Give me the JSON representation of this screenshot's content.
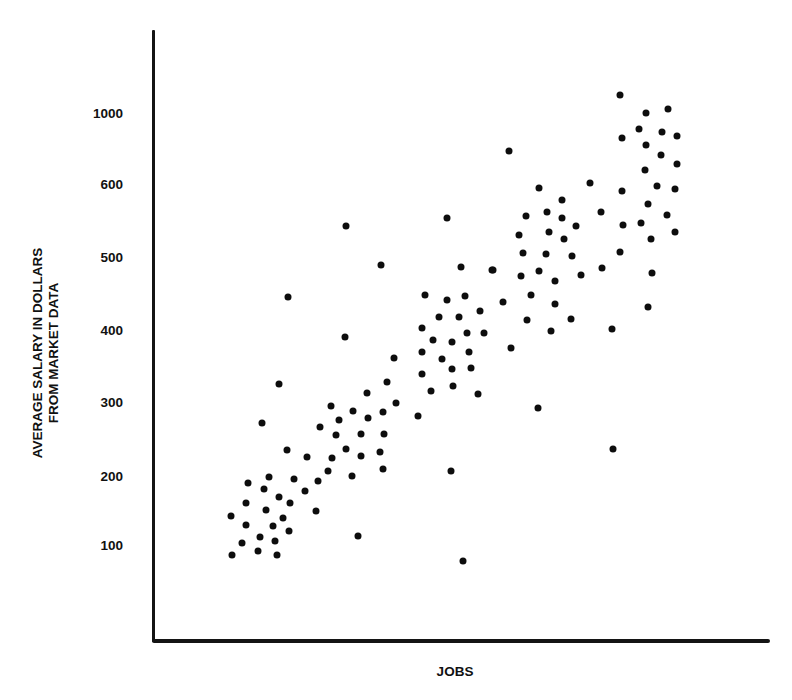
{
  "chart_data": {
    "type": "scatter",
    "title": "",
    "xlabel": "JOBS",
    "ylabel": "AVERAGE SALARY IN DOLLARS FROM MARKET DATA",
    "ylabel_lines": [
      "AVERAGE SALARY IN DOLLARS",
      "FROM MARKET DATA"
    ],
    "yticks": [
      100,
      200,
      300,
      400,
      500,
      600,
      1000
    ],
    "ytick_labels": [
      "100",
      "200",
      "300",
      "400",
      "500",
      "600",
      "1000"
    ],
    "y_scale_note": "non-uniform axis: equal spacing between 100..600 and 600..1000",
    "xticks": [],
    "xlim": [
      0,
      100
    ],
    "ylim": [
      0,
      1200
    ],
    "grid": false,
    "legend": null,
    "x_units": "relative position along unlabeled JOBS axis (0-100)",
    "series": [
      {
        "name": "jobs",
        "color": "#0d0d0d",
        "points": [
          {
            "x": 12.8,
            "y": 86
          },
          {
            "x": 14.4,
            "y": 103
          },
          {
            "x": 12.6,
            "y": 142
          },
          {
            "x": 15.1,
            "y": 129
          },
          {
            "x": 15.1,
            "y": 161
          },
          {
            "x": 15.4,
            "y": 190
          },
          {
            "x": 18.8,
            "y": 199
          },
          {
            "x": 18.0,
            "y": 181
          },
          {
            "x": 17.0,
            "y": 91
          },
          {
            "x": 17.3,
            "y": 112
          },
          {
            "x": 18.3,
            "y": 151
          },
          {
            "x": 19.4,
            "y": 128
          },
          {
            "x": 19.8,
            "y": 106
          },
          {
            "x": 20.1,
            "y": 86
          },
          {
            "x": 20.4,
            "y": 170
          },
          {
            "x": 21.1,
            "y": 139
          },
          {
            "x": 22.2,
            "y": 161
          },
          {
            "x": 22.0,
            "y": 120
          },
          {
            "x": 22.9,
            "y": 196
          },
          {
            "x": 24.6,
            "y": 178
          },
          {
            "x": 26.4,
            "y": 149
          },
          {
            "x": 26.7,
            "y": 193
          },
          {
            "x": 25.0,
            "y": 226
          },
          {
            "x": 21.7,
            "y": 235
          },
          {
            "x": 28.4,
            "y": 207
          },
          {
            "x": 21.9,
            "y": 445
          },
          {
            "x": 20.4,
            "y": 325
          },
          {
            "x": 17.7,
            "y": 272
          },
          {
            "x": 29.0,
            "y": 224
          },
          {
            "x": 31.3,
            "y": 236
          },
          {
            "x": 33.7,
            "y": 227
          },
          {
            "x": 36.8,
            "y": 232
          },
          {
            "x": 37.3,
            "y": 209
          },
          {
            "x": 32.3,
            "y": 200
          },
          {
            "x": 27.1,
            "y": 266
          },
          {
            "x": 29.7,
            "y": 255
          },
          {
            "x": 33.7,
            "y": 257
          },
          {
            "x": 37.4,
            "y": 257
          },
          {
            "x": 30.1,
            "y": 276
          },
          {
            "x": 28.8,
            "y": 295
          },
          {
            "x": 32.4,
            "y": 288
          },
          {
            "x": 34.8,
            "y": 278
          },
          {
            "x": 37.3,
            "y": 286
          },
          {
            "x": 34.7,
            "y": 313
          },
          {
            "x": 37.9,
            "y": 328
          },
          {
            "x": 39.4,
            "y": 299
          },
          {
            "x": 39.1,
            "y": 361
          },
          {
            "x": 31.1,
            "y": 390
          },
          {
            "x": 31.3,
            "y": 542
          },
          {
            "x": 37.0,
            "y": 489
          },
          {
            "x": 47.6,
            "y": 553
          },
          {
            "x": 49.9,
            "y": 486
          },
          {
            "x": 54.9,
            "y": 482
          },
          {
            "x": 44.1,
            "y": 448
          },
          {
            "x": 47.6,
            "y": 441
          },
          {
            "x": 50.6,
            "y": 447
          },
          {
            "x": 53.0,
            "y": 426
          },
          {
            "x": 46.4,
            "y": 418
          },
          {
            "x": 49.6,
            "y": 418
          },
          {
            "x": 43.6,
            "y": 403
          },
          {
            "x": 50.9,
            "y": 396
          },
          {
            "x": 53.6,
            "y": 396
          },
          {
            "x": 45.4,
            "y": 386
          },
          {
            "x": 48.5,
            "y": 383
          },
          {
            "x": 43.6,
            "y": 369
          },
          {
            "x": 51.2,
            "y": 369
          },
          {
            "x": 46.8,
            "y": 360
          },
          {
            "x": 48.5,
            "y": 346
          },
          {
            "x": 51.5,
            "y": 347
          },
          {
            "x": 43.6,
            "y": 339
          },
          {
            "x": 48.6,
            "y": 322
          },
          {
            "x": 45.1,
            "y": 315
          },
          {
            "x": 52.7,
            "y": 311
          },
          {
            "x": 42.9,
            "y": 281
          },
          {
            "x": 48.3,
            "y": 207
          },
          {
            "x": 33.2,
            "y": 113
          },
          {
            "x": 50.2,
            "y": 77
          },
          {
            "x": 57.7,
            "y": 786
          },
          {
            "x": 62.6,
            "y": 595
          },
          {
            "x": 70.8,
            "y": 606
          },
          {
            "x": 66.3,
            "y": 578
          },
          {
            "x": 60.5,
            "y": 556
          },
          {
            "x": 63.9,
            "y": 562
          },
          {
            "x": 66.3,
            "y": 553
          },
          {
            "x": 72.6,
            "y": 562
          },
          {
            "x": 68.6,
            "y": 542
          },
          {
            "x": 59.3,
            "y": 530
          },
          {
            "x": 64.2,
            "y": 534
          },
          {
            "x": 66.6,
            "y": 525
          },
          {
            "x": 60.0,
            "y": 505
          },
          {
            "x": 63.7,
            "y": 504
          },
          {
            "x": 67.9,
            "y": 501
          },
          {
            "x": 55.1,
            "y": 482
          },
          {
            "x": 62.6,
            "y": 481
          },
          {
            "x": 59.6,
            "y": 474
          },
          {
            "x": 69.4,
            "y": 475
          },
          {
            "x": 72.8,
            "y": 485
          },
          {
            "x": 65.2,
            "y": 467
          },
          {
            "x": 61.3,
            "y": 448
          },
          {
            "x": 56.7,
            "y": 438
          },
          {
            "x": 65.2,
            "y": 436
          },
          {
            "x": 60.6,
            "y": 414
          },
          {
            "x": 67.7,
            "y": 415
          },
          {
            "x": 64.5,
            "y": 399
          },
          {
            "x": 74.4,
            "y": 401
          },
          {
            "x": 58.0,
            "y": 375
          },
          {
            "x": 62.4,
            "y": 292
          },
          {
            "x": 74.6,
            "y": 236
          },
          {
            "x": 80.2,
            "y": 432
          },
          {
            "x": 75.7,
            "y": 1101
          },
          {
            "x": 79.9,
            "y": 1000
          },
          {
            "x": 83.5,
            "y": 1023
          },
          {
            "x": 78.8,
            "y": 910
          },
          {
            "x": 82.5,
            "y": 893
          },
          {
            "x": 84.9,
            "y": 870
          },
          {
            "x": 76.0,
            "y": 859
          },
          {
            "x": 79.9,
            "y": 820
          },
          {
            "x": 82.3,
            "y": 763
          },
          {
            "x": 84.9,
            "y": 713
          },
          {
            "x": 79.7,
            "y": 679
          },
          {
            "x": 76.0,
            "y": 590
          },
          {
            "x": 81.7,
            "y": 597
          },
          {
            "x": 84.6,
            "y": 593
          },
          {
            "x": 80.2,
            "y": 573
          },
          {
            "x": 83.3,
            "y": 558
          },
          {
            "x": 76.2,
            "y": 544
          },
          {
            "x": 79.1,
            "y": 547
          },
          {
            "x": 84.6,
            "y": 534
          },
          {
            "x": 80.7,
            "y": 525
          },
          {
            "x": 75.7,
            "y": 507
          },
          {
            "x": 80.9,
            "y": 478
          }
        ]
      }
    ]
  },
  "layout_hints": {
    "ytick_pixels": {
      "100": 545,
      "200": 476,
      "300": 402,
      "400": 330,
      "500": 257,
      "600": 184,
      "1000": 113
    },
    "x_axis_px": [
      153,
      770
    ]
  }
}
